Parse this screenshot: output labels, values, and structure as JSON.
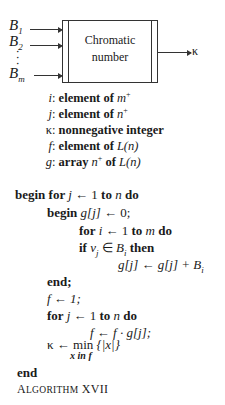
{
  "diagram": {
    "box_label_line1": "Chromatic",
    "box_label_line2": "number",
    "inputs": [
      {
        "name": "B",
        "sub": "1"
      },
      {
        "name": "B",
        "sub": "2"
      },
      {
        "name": "B",
        "sub": "m"
      }
    ],
    "vdots": "⋮",
    "output": "κ"
  },
  "declarations": [
    {
      "var": "i",
      "desc": "element of ",
      "type": "m",
      "sup": "+"
    },
    {
      "var": "j",
      "desc": "element of ",
      "type": "n",
      "sup": "+"
    },
    {
      "var": "κ",
      "desc": "nonnegative integer",
      "type": "",
      "sup": ""
    },
    {
      "var": "f",
      "desc": "element of ",
      "type": "L(n)",
      "sup": ""
    },
    {
      "var": "g",
      "desc": "array ",
      "type": "n",
      "sup": "+",
      "tail": " of ",
      "tail_type": "L(n)"
    }
  ],
  "code": {
    "l1_kw": "begin for ",
    "l1_var": "j",
    "l1_mid": " ← 1 ",
    "l1_kw2": "to ",
    "l1_n": "n",
    "l1_kw3": " do",
    "l2_kw": "begin ",
    "l2_expr": "g[j]",
    "l2_rest": " ← 0;",
    "l3_kw": "for ",
    "l3_var": "i",
    "l3_mid": " ← 1 ",
    "l3_kw2": "to ",
    "l3_m": "m",
    "l3_kw3": " do",
    "l4_kw": "if ",
    "l4_v": "v",
    "l4_vsub": "j",
    "l4_in": " ∈ ",
    "l4_B": "B",
    "l4_Bsub": "i",
    "l4_kw2": " then",
    "l5_expr": "g[j] ← g[j] + ",
    "l5_B": "B",
    "l5_Bsub": "i",
    "l6": "end;",
    "l7": "f ← 1;",
    "l8_kw": "for ",
    "l8_var": "j",
    "l8_mid": " ← 1 ",
    "l8_kw2": "to ",
    "l8_n": "n",
    "l8_kw3": " do",
    "l9": "f ← f · g[j];",
    "l10_lhs": "κ ← ",
    "l10_min": "min",
    "l10_under": "x in f",
    "l10_set": " {|x|}",
    "l11": "end"
  },
  "caption": {
    "first": "A",
    "rest": "LGORITHM",
    "num": " XVII"
  }
}
